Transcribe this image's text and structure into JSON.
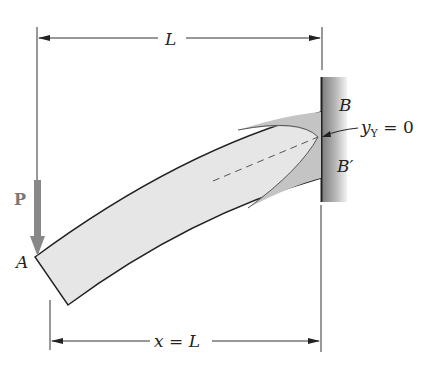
{
  "figure": {
    "top_dimension": {
      "label": "L"
    },
    "bottom_dimension": {
      "label": "x = L"
    },
    "load": {
      "label": "P",
      "direction": "down"
    },
    "points": {
      "free_end": "A",
      "fixed_top": "B",
      "fixed_bottom": "B′"
    },
    "annotation": {
      "label": "y",
      "subscript": "Y",
      "value_text": " = 0"
    },
    "colors": {
      "beam_fill": "#e6e6e6",
      "plastic_zone": "#c4c4c4",
      "wall": "#9a9a9a",
      "arrow": "#888888",
      "line": "#222222"
    }
  }
}
